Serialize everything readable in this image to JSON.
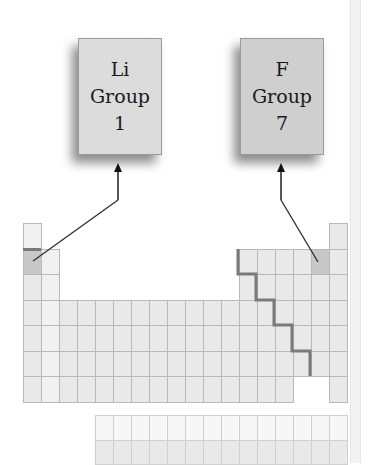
{
  "callouts": [
    {
      "element": "Li",
      "group_label": "Group",
      "group_number": "1",
      "color": "#dcdcdc"
    },
    {
      "element": "F",
      "group_label": "Group",
      "group_number": "7",
      "color": "#cfcfcf"
    }
  ],
  "periodic_table": {
    "highlighted_cells": [
      "Li",
      "F"
    ],
    "highlight_color": "#c8c8c8",
    "cell_color": "#e9e9e9",
    "s_block_color": "#f1f1f1",
    "f_block_color": "#f7f7f7",
    "staircase_color": "#7a7a7a"
  }
}
